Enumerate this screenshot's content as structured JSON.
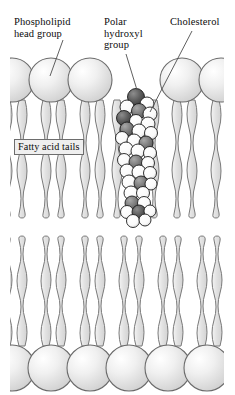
{
  "figure": {
    "type": "biology-diagram",
    "background_color": "#ffffff",
    "canvas": {
      "width": 235,
      "height": 395
    }
  },
  "labels": {
    "phospholipid_head_group": "Phospholipid\nhead group",
    "polar_hydroxyl_group": "Polar\nhydroxyl\ngroup",
    "cholesterol": "Cholesterol",
    "fatty_acid_tails": "Fatty acid tails"
  },
  "colors": {
    "head_fill": "#dcdcdc",
    "head_highlight": "#f7f7f7",
    "head_stroke": "#6b6b6b",
    "tail_fill": "#dedede",
    "tail_stroke": "#7a7a7a",
    "sterol_light": "#ffffff",
    "sterol_dark": "#4a4a4a",
    "sterol_mid": "#6f6f6f",
    "sterol_stroke": "#1a1a1a",
    "leader_line": "#4e4e4e",
    "callout_fill": "#efefef",
    "callout_border": "#6d6d6d",
    "text": "#0c0c0c"
  },
  "structure": {
    "upper_leaflet": {
      "head_count": 6,
      "head_centers_x": [
        12,
        51,
        90,
        143,
        182,
        221
      ],
      "head_center_y": 80,
      "head_radius": 22,
      "tails_per_head": 2,
      "tail_top_y": 100,
      "tail_bottom_y": 218
    },
    "lower_leaflet": {
      "head_count": 6,
      "head_centers_x": [
        12,
        51,
        90,
        129,
        168,
        207
      ],
      "head_center_y": 368,
      "head_radius": 23,
      "tails_per_head": 2,
      "tail_top_y": 224,
      "tail_bottom_y": 346
    },
    "cholesterol_molecule": {
      "label": "cholesterol",
      "position_x": 134,
      "top_y": 88,
      "bottom_y": 232,
      "hydroxyl_sphere": {
        "cx": 135,
        "cy": 96,
        "r": 8,
        "shade": "dark"
      },
      "atom_count": 30
    },
    "membrane_bounds": {
      "left": 10,
      "right": 224,
      "top": 50,
      "bottom": 392
    }
  },
  "leader_lines": [
    {
      "name": "phospholipid-leader",
      "x1": 63,
      "y1": 40,
      "x2": 50,
      "y2": 74
    },
    {
      "name": "polar-hydroxyl-leader",
      "x1": 126,
      "y1": 54,
      "x2": 137,
      "y2": 90
    },
    {
      "name": "cholesterol-leader",
      "x1": 191,
      "y1": 32,
      "x2": 150,
      "y2": 110
    }
  ]
}
